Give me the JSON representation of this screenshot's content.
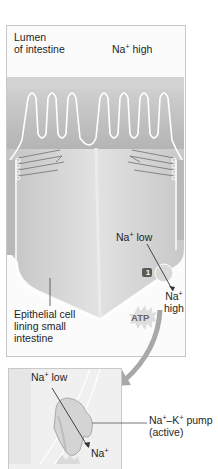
{
  "top_panel": {
    "lumen_label": [
      "Lumen",
      "of intestine"
    ],
    "lumen_na": {
      "ion": "Na",
      "charge": "+",
      "level": "high"
    },
    "cell_na": {
      "ion": "Na",
      "charge": "+",
      "level": "low"
    },
    "exit_na": {
      "ion": "Na",
      "charge": "+",
      "level": "high"
    },
    "step_badge": "1",
    "atp_label": "ATP",
    "cell_label": [
      "Epithelial cell",
      "lining small",
      "intestine"
    ]
  },
  "bottom_panel": {
    "na_low": {
      "ion": "Na",
      "charge": "+",
      "level": "low"
    },
    "na_out": {
      "ion": "Na",
      "charge": "+"
    },
    "pump_label": [
      "Na+–K+ pump",
      "(active)"
    ],
    "pump_name_parts": {
      "a": "Na",
      "a_sup": "+",
      "dash": "–K",
      "b_sup": "+",
      "rest": " pump"
    },
    "pump_type": "(active)"
  },
  "colors": {
    "frame_border": "#c8c8c8",
    "villi_fill": "#bdbdbd",
    "cell_fill": "#d6d6d6",
    "outline_white": "#ffffff",
    "badge": "#555555",
    "arrow_gray": "#9a9a9a"
  }
}
